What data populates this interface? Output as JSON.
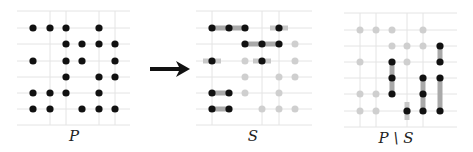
{
  "colors": {
    "grid": "#e4e4e4",
    "dot_black": "#111111",
    "dot_gray": "#cfcfcf",
    "bar_gray": "#a9a9a9",
    "bar_light": "#c8c8c8",
    "arrow": "#111111"
  },
  "arrow": {
    "x1": 150,
    "y1": 69,
    "x2": 190,
    "y2": 69
  },
  "panels": [
    {
      "id": "P",
      "label": "P",
      "label_pos": {
        "x": 74,
        "y": 127
      },
      "frame": {
        "x0": 17,
        "x1": 130,
        "y0": 11,
        "y1": 125
      },
      "cols": [
        33,
        50,
        66,
        82,
        99,
        115
      ],
      "rows": [
        28,
        44,
        61,
        77,
        93,
        109
      ],
      "vlines": [
        50,
        66,
        99,
        115
      ],
      "black": [
        [
          1,
          1
        ],
        [
          2,
          1
        ],
        [
          3,
          1
        ],
        [
          5,
          1
        ],
        [
          3,
          2
        ],
        [
          4,
          2
        ],
        [
          5,
          2
        ],
        [
          6,
          2
        ],
        [
          1,
          3
        ],
        [
          3,
          3
        ],
        [
          4,
          3
        ],
        [
          6,
          3
        ],
        [
          3,
          4
        ],
        [
          5,
          4
        ],
        [
          6,
          4
        ],
        [
          1,
          5
        ],
        [
          2,
          5
        ],
        [
          3,
          5
        ],
        [
          5,
          5
        ],
        [
          1,
          6
        ],
        [
          2,
          6
        ],
        [
          4,
          6
        ],
        [
          5,
          6
        ],
        [
          6,
          6
        ]
      ],
      "gray": [],
      "bars": []
    },
    {
      "id": "S",
      "label": "S",
      "label_pos": {
        "x": 253,
        "y": 127
      },
      "frame": {
        "x0": 196,
        "x1": 312,
        "y0": 11,
        "y1": 125
      },
      "cols": [
        212,
        229,
        245,
        262,
        279,
        295
      ],
      "rows": [
        28,
        44,
        61,
        77,
        93,
        109
      ],
      "vlines": [
        212,
        262,
        279
      ],
      "black": [
        [
          1,
          1
        ],
        [
          2,
          1
        ],
        [
          3,
          1
        ],
        [
          5,
          1
        ],
        [
          3,
          2
        ],
        [
          4,
          2
        ],
        [
          5,
          2
        ],
        [
          1,
          3
        ],
        [
          4,
          3
        ],
        [
          1,
          5
        ],
        [
          2,
          5
        ],
        [
          1,
          6
        ],
        [
          2,
          6
        ]
      ],
      "gray": [
        [
          6,
          2
        ],
        [
          3,
          3
        ],
        [
          6,
          3
        ],
        [
          3,
          4
        ],
        [
          5,
          4
        ],
        [
          6,
          4
        ],
        [
          3,
          5
        ],
        [
          5,
          5
        ],
        [
          4,
          6
        ],
        [
          5,
          6
        ],
        [
          6,
          6
        ]
      ],
      "bars": [
        {
          "orient": "h",
          "row": 1,
          "from": 1,
          "to": 3
        },
        {
          "orient": "h-short",
          "row": 1,
          "at": 5
        },
        {
          "orient": "h",
          "row": 2,
          "from": 3,
          "to": 5
        },
        {
          "orient": "h-short",
          "row": 3,
          "at": 1
        },
        {
          "orient": "h-short",
          "row": 3,
          "at": 4
        },
        {
          "orient": "h",
          "row": 5,
          "from": 1,
          "to": 2
        },
        {
          "orient": "h",
          "row": 6,
          "from": 1,
          "to": 2
        }
      ]
    },
    {
      "id": "P_minus_S",
      "label": "P \\ S",
      "label_pos": {
        "x": 396,
        "y": 129
      },
      "frame": {
        "x0": 344,
        "x1": 457,
        "y0": 13,
        "y1": 127
      },
      "cols": [
        360,
        376,
        392,
        407,
        423,
        440
      ],
      "rows": [
        30,
        46,
        62,
        78,
        94,
        111
      ],
      "vlines": [
        360,
        376,
        407,
        423
      ],
      "black": [
        [
          6,
          2
        ],
        [
          3,
          3
        ],
        [
          6,
          3
        ],
        [
          3,
          4
        ],
        [
          5,
          4
        ],
        [
          6,
          4
        ],
        [
          3,
          5
        ],
        [
          5,
          5
        ],
        [
          4,
          6
        ],
        [
          5,
          6
        ],
        [
          6,
          6
        ]
      ],
      "gray": [
        [
          1,
          1
        ],
        [
          2,
          1
        ],
        [
          3,
          1
        ],
        [
          5,
          1
        ],
        [
          3,
          2
        ],
        [
          4,
          2
        ],
        [
          5,
          2
        ],
        [
          1,
          3
        ],
        [
          4,
          3
        ],
        [
          1,
          5
        ],
        [
          2,
          5
        ],
        [
          1,
          6
        ],
        [
          2,
          6
        ]
      ],
      "bars": [
        {
          "orient": "v",
          "col": 6,
          "from": 2,
          "to": 3
        },
        {
          "orient": "v",
          "col": 3,
          "from": 3,
          "to": 5
        },
        {
          "orient": "v",
          "col": 5,
          "from": 4,
          "to": 6
        },
        {
          "orient": "v",
          "col": 6,
          "from": 4,
          "to": 6
        },
        {
          "orient": "v-short",
          "col": 4,
          "at": 6
        }
      ]
    }
  ]
}
